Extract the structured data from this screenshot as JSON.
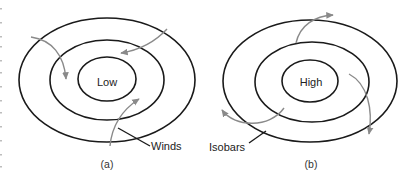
{
  "diagram": {
    "panels": [
      {
        "id": "a",
        "caption": "(a)",
        "center_label": "Low",
        "callout_label": "Winds",
        "wind_color": "#8a8a8a"
      },
      {
        "id": "b",
        "caption": "(b)",
        "center_label": "High",
        "callout_label": "Isobars",
        "wind_color": "#8a8a8a"
      }
    ],
    "colors": {
      "isobar": "#1a1a1a",
      "wind_arrow": "#8a8a8a",
      "background": "#ffffff"
    }
  }
}
